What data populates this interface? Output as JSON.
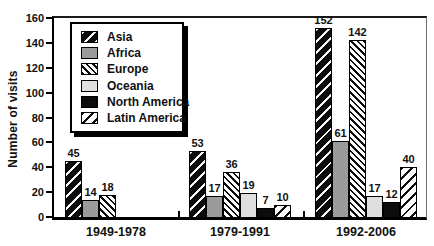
{
  "chart_data": {
    "type": "bar",
    "title": "",
    "ylabel": "Number of visits",
    "xlabel": "",
    "categories": [
      "1949-1978",
      "1979-1991",
      "1992-2006"
    ],
    "series": [
      {
        "name": "Asia",
        "key": "asia",
        "pattern": "white-diagonal-stripes-on-black",
        "values": [
          45,
          53,
          152
        ]
      },
      {
        "name": "Africa",
        "key": "africa",
        "pattern": "solid-gray",
        "values": [
          14,
          17,
          61
        ]
      },
      {
        "name": "Europe",
        "key": "europe",
        "pattern": "fine-black-backslash-stripes",
        "values": [
          18,
          36,
          142
        ]
      },
      {
        "name": "Oceania",
        "key": "oceania",
        "pattern": "solid-light-gray",
        "values": [
          0,
          19,
          17
        ]
      },
      {
        "name": "North America",
        "key": "north-america",
        "pattern": "solid-black",
        "values": [
          0,
          7,
          12
        ]
      },
      {
        "name": "Latin America",
        "key": "latin-america",
        "pattern": "black-slash-stripes-on-white",
        "values": [
          0,
          10,
          40
        ]
      }
    ],
    "yticks": [
      0,
      20,
      40,
      60,
      80,
      100,
      120,
      140,
      160
    ],
    "ylim": [
      0,
      160
    ],
    "grid": false,
    "legend_position": "top-left",
    "bar_labels_shown": true,
    "colors": {
      "africa_gray": "#9b9b9b",
      "oceania_light_gray": "#dfdfdf",
      "ink_black": "#0c0c0c",
      "background": "#ffffff"
    }
  }
}
